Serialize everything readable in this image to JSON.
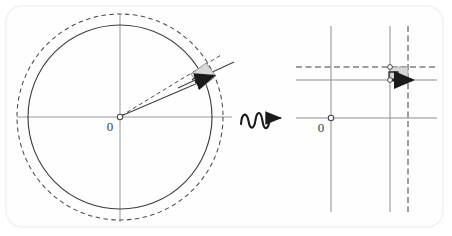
{
  "figure": {
    "title": "",
    "caption": "",
    "background_color": "#ffffff",
    "panel": {
      "name": "rounded-card",
      "x": 6,
      "y": 6,
      "width": 437,
      "height": 221,
      "corner_radius": 16,
      "fill": "#fefeff",
      "stroke": "#f1f2f4"
    },
    "colors": {
      "stroke_dark": "#4a4a4a",
      "stroke_medium": "#6e6e6e",
      "stroke_light": "#9a9aa0",
      "shade_fill": "#d8d8d8",
      "ink_black": "#1a1a1a",
      "label_color": "#3a3a3a"
    }
  },
  "left_panel": {
    "name": "circle-diagram",
    "origin_label": "0",
    "origin": {
      "x": 120,
      "y": 117
    },
    "solid_circle": {
      "cx": 120,
      "cy": 117,
      "r": 92,
      "style": "solid"
    },
    "dashed_circle": {
      "cx": 120,
      "cy": 117,
      "r": 103,
      "style": "dashed"
    },
    "horizontal_axis": {
      "x1": 17,
      "y1": 117,
      "x2": 232,
      "y2": 117
    },
    "vertical_axis": {
      "x1": 120,
      "y1": 14,
      "x2": 120,
      "y2": 222
    },
    "radius_vector": {
      "x1": 120,
      "y1": 117,
      "x2": 211,
      "y2": 78,
      "style": "solid",
      "label": ""
    },
    "radius_vector_dashed": {
      "x1": 120,
      "y1": 117,
      "x2": 220,
      "y2": 56,
      "style": "dashed",
      "label": ""
    },
    "tangent_line": {
      "x1": 180,
      "y1": 86,
      "x2": 233,
      "y2": 63,
      "style": "solid"
    },
    "shaded_cell": {
      "points": "191,74 206,63 216,76 201,88",
      "fill": "#d8d8d8",
      "stroke": "#8a8a8a"
    },
    "arrow_vector": {
      "x1": 197,
      "y1": 81,
      "x2": 217,
      "y2": 74
    }
  },
  "connector": {
    "name": "wavy-arrow",
    "style": "squiggle-arrow",
    "x": 240,
    "y": 117,
    "length": 45,
    "direction": "right"
  },
  "right_panel": {
    "name": "zoomed-grid-diagram",
    "origin_label": "0",
    "origin": {
      "x": 331,
      "y": 118
    },
    "horizontal_axis": {
      "x1": 296,
      "y1": 118,
      "x2": 437,
      "y2": 118
    },
    "vertical_axis": {
      "x1": 331,
      "y1": 26,
      "x2": 331,
      "y2": 212
    },
    "grid_lines": [
      {
        "id": "h-solid-upper",
        "orientation": "horizontal",
        "style": "solid",
        "x1": 296,
        "y1": 80,
        "x2": 437,
        "y2": 80
      },
      {
        "id": "h-dashed-upper",
        "orientation": "horizontal",
        "style": "dashed",
        "x1": 296,
        "y1": 67,
        "x2": 437,
        "y2": 67
      },
      {
        "id": "v-solid-right",
        "orientation": "vertical",
        "style": "solid",
        "x1": 390,
        "y1": 26,
        "x2": 390,
        "y2": 212
      },
      {
        "id": "v-dashed-right",
        "orientation": "vertical",
        "style": "dashed",
        "x1": 408,
        "y1": 26,
        "x2": 408,
        "y2": 212
      }
    ],
    "shaded_cell": {
      "x": 390,
      "y": 67,
      "width": 18,
      "height": 13,
      "fill": "#d8d8d8",
      "stroke": "#9a9a9a"
    },
    "node_top": {
      "x": 390,
      "y": 67
    },
    "node_bottom": {
      "x": 390,
      "y": 80
    },
    "step_path": "M389,80 L389,72 L398,72 L398,80",
    "arrow_vector": {
      "x1": 390,
      "y1": 80,
      "x2": 412,
      "y2": 80
    }
  }
}
